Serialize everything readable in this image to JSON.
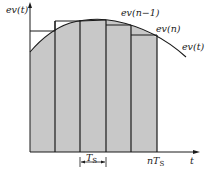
{
  "diagram": {
    "y_axis_label": "ev(t)",
    "x_axis_label": "t",
    "curve_label": "ev(t)",
    "sample_labels": {
      "prev": "ev(n−1)",
      "current": "ev(n)"
    },
    "period_label": "T",
    "period_subscript": "S",
    "end_label_prefix": "nT",
    "end_label_subscript": "S",
    "num_intervals": 5,
    "colors": {
      "fill": "#c8c8c8",
      "line": "#1a1a1a"
    }
  }
}
